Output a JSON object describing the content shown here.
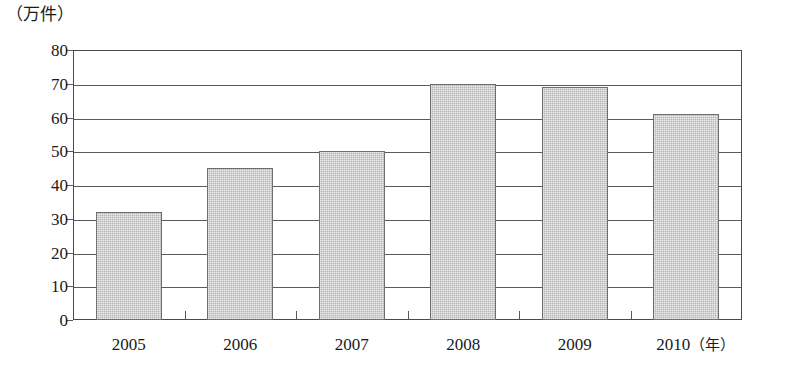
{
  "chart_data": {
    "type": "bar",
    "title": "",
    "subtitle": "",
    "xlabel": "年",
    "ylabel": "万件",
    "unit_label": "（万件）",
    "year_suffix": "（年）",
    "categories": [
      "2005",
      "2006",
      "2007",
      "2008",
      "2009",
      "2010"
    ],
    "values": [
      32,
      45,
      50,
      70,
      69,
      61
    ],
    "series": [
      {
        "name": "件数",
        "values": [
          32,
          45,
          50,
          70,
          69,
          61
        ]
      }
    ],
    "ylim": [
      0,
      80
    ],
    "ytick_values": [
      0,
      10,
      20,
      30,
      40,
      50,
      60,
      70,
      80
    ],
    "ytick_labels": [
      "0",
      "10",
      "20",
      "30",
      "40",
      "50",
      "60",
      "70",
      "80"
    ],
    "grid": true,
    "grid_axis": "y",
    "legend": false,
    "legend_position": "none",
    "annotations": [],
    "colors": {
      "bar_fill": "#b6b6b6",
      "bar_border": "#6e6e6e",
      "gridline": "#5a5a5a",
      "frame": "#4a4a4a",
      "text": "#1a1a1a",
      "background": "#ffffff"
    }
  }
}
